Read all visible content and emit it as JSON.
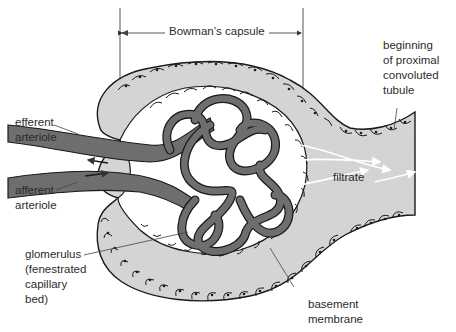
{
  "diagram": {
    "labels": {
      "bowmans_capsule": "Bowman’s capsule",
      "proximal_tubule": "beginning\nof proximal\nconvoluted\ntubule",
      "efferent_arteriole": "efferent\narteriole",
      "afferent_arteriole": "afferent\narteriole",
      "filtrate": "filtrate",
      "glomerulus": "glomerulus\n(fenestrated\ncapillary\nbed)",
      "basement_membrane": "basement\nmembrane"
    },
    "colors": {
      "capsule_fill": "#d4d4d4",
      "vessel_fill": "#6e6e6e",
      "outline": "#1a1a1a",
      "label_text": "#2b2b2b",
      "background": "#ffffff"
    }
  }
}
